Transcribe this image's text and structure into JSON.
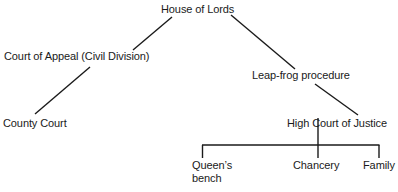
{
  "diagram": {
    "type": "hierarchy",
    "line_color": "#1a1a1a",
    "nodes": {
      "house_of_lords": "House of Lords",
      "court_of_appeal": "Court of Appeal (Civil Division)",
      "leap_frog": "Leap-frog procedure",
      "county_court": "County Court",
      "high_court": "High Court of Justice",
      "queens_bench_line1": "Queen’s",
      "queens_bench_line2": "bench",
      "chancery": "Chancery",
      "family": "Family"
    },
    "edges": [
      {
        "from": "House of Lords",
        "to": "Court of Appeal (Civil Division)"
      },
      {
        "from": "Court of Appeal (Civil Division)",
        "to": "County Court"
      },
      {
        "from": "House of Lords",
        "to": "Leap-frog procedure"
      },
      {
        "from": "Leap-frog procedure",
        "to": "High Court of Justice"
      },
      {
        "from": "High Court of Justice",
        "to": "Queen’s bench"
      },
      {
        "from": "High Court of Justice",
        "to": "Chancery"
      },
      {
        "from": "High Court of Justice",
        "to": "Family"
      }
    ]
  }
}
